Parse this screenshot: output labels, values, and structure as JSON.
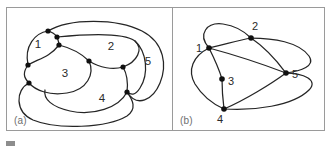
{
  "figure": {
    "panels": [
      {
        "id": "a",
        "label": "(a)",
        "type": "planar-graph-with-regions",
        "region_labels": [
          "1",
          "2",
          "3",
          "4",
          "5"
        ],
        "vertex_count": 8
      },
      {
        "id": "b",
        "label": "(b)",
        "type": "dual-graph",
        "node_labels": [
          "1",
          "2",
          "3",
          "4",
          "5"
        ],
        "vertex_count": 5
      }
    ],
    "caption": {
      "marker": "",
      "text": ""
    },
    "colors": {
      "stroke": "#252525",
      "node_fill": "#101010",
      "border": "#9a9a9a",
      "label_text": "#2a2a2a",
      "panel_label_text": "#6e6e6e",
      "background": "#ffffff"
    }
  },
  "panel_a": {
    "regions": [
      {
        "label": "1",
        "x": 31,
        "y": 36
      },
      {
        "label": "2",
        "x": 104,
        "y": 38
      },
      {
        "label": "3",
        "x": 58,
        "y": 65
      },
      {
        "label": "4",
        "x": 95,
        "y": 90
      },
      {
        "label": "5",
        "x": 141,
        "y": 53
      }
    ],
    "vertices": [
      {
        "id": "v1",
        "x": 41,
        "y": 23
      },
      {
        "id": "v2",
        "x": 50,
        "y": 29
      },
      {
        "id": "v3",
        "x": 52,
        "y": 37
      },
      {
        "id": "v4",
        "x": 21,
        "y": 57
      },
      {
        "id": "v5",
        "x": 22,
        "y": 75
      },
      {
        "id": "v6",
        "x": 82,
        "y": 53
      },
      {
        "id": "v7",
        "x": 116,
        "y": 59
      },
      {
        "id": "v8",
        "x": 120,
        "y": 84
      }
    ]
  },
  "panel_b": {
    "nodes": [
      {
        "label": "1",
        "x": 36,
        "y": 40,
        "lx": 26,
        "ly": 35
      },
      {
        "label": "2",
        "x": 78,
        "y": 30,
        "lx": 83,
        "ly": 22
      },
      {
        "label": "3",
        "x": 49,
        "y": 71,
        "lx": 57,
        "ly": 76
      },
      {
        "label": "4",
        "x": 51,
        "y": 101,
        "lx": 46,
        "ly": 116
      },
      {
        "label": "5",
        "x": 113,
        "y": 65,
        "lx": 120,
        "ly": 70
      }
    ],
    "edges": [
      {
        "from": "1",
        "to": "2"
      },
      {
        "from": "1",
        "to": "2",
        "variant": "outer-loop"
      },
      {
        "from": "1",
        "to": "3"
      },
      {
        "from": "1",
        "to": "4"
      },
      {
        "from": "1",
        "to": "5"
      },
      {
        "from": "2",
        "to": "5"
      },
      {
        "from": "2",
        "to": "5",
        "variant": "outer-sweep"
      },
      {
        "from": "3",
        "to": "4"
      },
      {
        "from": "4",
        "to": "5"
      },
      {
        "from": "4",
        "to": "5",
        "variant": "outer-sweep"
      }
    ]
  }
}
